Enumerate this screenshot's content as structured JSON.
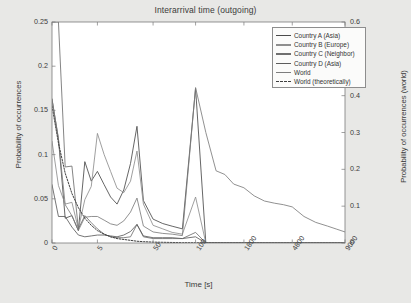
{
  "chart_data": {
    "type": "line",
    "title": "Interarrival time (outgoing)",
    "xlabel": "Time [s]",
    "ylabel": "Probability of occurrences",
    "ylabel_right": "Probability of occurrences (world)",
    "ylim": [
      0,
      0.25
    ],
    "ylim_right": [
      0,
      0.6
    ],
    "yticks": [
      "0",
      "0.05",
      "0.1",
      "0.15",
      "0.2",
      "0.25"
    ],
    "ytick_values": [
      0,
      0.05,
      0.1,
      0.15,
      0.2,
      0.25
    ],
    "yticks_right": [
      "0",
      "0.1",
      "0.2",
      "0.3",
      "0.4",
      "0.5",
      "0.6"
    ],
    "ytick_values_right": [
      0,
      0.1,
      0.2,
      0.3,
      0.4,
      0.5,
      0.6
    ],
    "xticks": [
      "0",
      "5",
      "50",
      "100",
      "1800",
      "4800",
      "9000"
    ],
    "xtick_positions": [
      0,
      0.155,
      0.345,
      0.49,
      0.655,
      0.82,
      1.0
    ],
    "grid": false,
    "legend_position": "top-right",
    "x_index": [
      0,
      0.022,
      0.045,
      0.068,
      0.09,
      0.112,
      0.134,
      0.155,
      0.178,
      0.2,
      0.222,
      0.245,
      0.268,
      0.29,
      0.312,
      0.345,
      0.378,
      0.41,
      0.445,
      0.49,
      0.525,
      0.56,
      0.59,
      0.62,
      0.655,
      0.69,
      0.725,
      0.76,
      0.79,
      0.82,
      0.86,
      0.9,
      0.94,
      0.97,
      1.0
    ],
    "series": [
      {
        "name": "Country A (Asia)",
        "axis": "left",
        "color": "#4a4a4a",
        "dash": false,
        "values": [
          0.163,
          0.118,
          0.028,
          0.031,
          0.014,
          0.092,
          0.07,
          0.081,
          0.066,
          0.052,
          0.044,
          0.06,
          0.09,
          0.132,
          0.048,
          0.027,
          0.022,
          0.019,
          0.016,
          0.175,
          0.0,
          0,
          0,
          0,
          0,
          0,
          0,
          0,
          0,
          0,
          0,
          0,
          0,
          0,
          0
        ]
      },
      {
        "name": "Country B (Europe)",
        "axis": "left",
        "color": "#8e8e8e",
        "dash": false,
        "values": [
          0.115,
          0.065,
          0.044,
          0.046,
          0.016,
          0.049,
          0.064,
          0.124,
          0.1,
          0.081,
          0.062,
          0.057,
          0.07,
          0.104,
          0.044,
          0.02,
          0.016,
          0.012,
          0.01,
          0.052,
          0.0,
          0,
          0,
          0,
          0,
          0,
          0,
          0,
          0,
          0,
          0,
          0,
          0,
          0,
          0
        ]
      },
      {
        "name": "Country C (Neighbor)",
        "axis": "left",
        "color": "#6f6f6f",
        "dash": false,
        "values": [
          0.25,
          0.25,
          0.086,
          0.087,
          0.016,
          0.031,
          0.023,
          0.016,
          0.01,
          0.007,
          0.006,
          0.006,
          0.007,
          0.021,
          0.007,
          0.005,
          0.005,
          0.005,
          0.005,
          0.012,
          0.0,
          0,
          0,
          0,
          0,
          0,
          0,
          0,
          0,
          0,
          0,
          0,
          0,
          0,
          0
        ]
      },
      {
        "name": "Country D (Asia)",
        "axis": "left",
        "color": "#5c5c5c",
        "dash": false,
        "values": [
          0.066,
          0.03,
          0.03,
          0.018,
          0.009,
          0.007,
          0.008,
          0.009,
          0.009,
          0.008,
          0.007,
          0.009,
          0.013,
          0.021,
          0.008,
          0.006,
          0.006,
          0.006,
          0.005,
          0.007,
          0.0,
          0,
          0,
          0,
          0,
          0,
          0,
          0,
          0,
          0,
          0,
          0,
          0,
          0,
          0
        ]
      },
      {
        "name": "World",
        "axis": "right",
        "color": "#7d7d7d",
        "dash": false,
        "values": [
          0.39,
          0.282,
          0.104,
          0.074,
          0.034,
          0.07,
          0.072,
          0.072,
          0.062,
          0.052,
          0.048,
          0.06,
          0.084,
          0.122,
          0.046,
          0.03,
          0.026,
          0.024,
          0.02,
          0.422,
          0.3,
          0.196,
          0.186,
          0.16,
          0.15,
          0.128,
          0.114,
          0.108,
          0.104,
          0.098,
          0.072,
          0.056,
          0.046,
          0.038,
          0.03
        ]
      },
      {
        "name": "World (theoretically)",
        "axis": "left",
        "color": "#3f3f3f",
        "dash": true,
        "values": [
          0.155,
          0.113,
          0.079,
          0.056,
          0.04,
          0.028,
          0.02,
          0.014,
          0.01,
          0.007,
          0.005,
          0.004,
          0.003,
          0.002,
          0.0015,
          0.001,
          0.0008,
          0.0006,
          0.0004,
          0.0003,
          0.0002,
          0.0002,
          0.0001,
          0.0001,
          0.0001,
          0.0001,
          0,
          0,
          0,
          0,
          0,
          0,
          0,
          0,
          0
        ]
      }
    ]
  }
}
